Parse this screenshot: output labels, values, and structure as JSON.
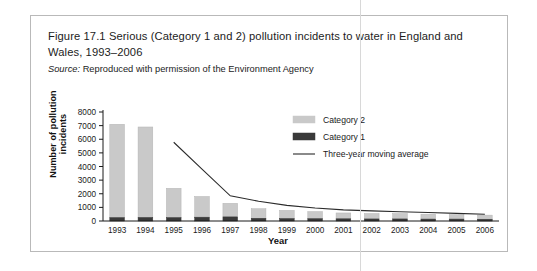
{
  "figure": {
    "caption_line1": "Figure 17.1  Serious (Category 1 and 2) pollution incidents to water in England and",
    "caption_line2": "Wales, 1993–2006",
    "source_label": "Source:",
    "source_text": "Reproduced with permission of the Environment Agency"
  },
  "chart_data": {
    "type": "bar",
    "title": "Figure 17.1  Serious (Category 1 and 2) pollution incidents to water in England and Wales, 1993–2006",
    "xlabel": "Year",
    "ylabel": "Number of pollution incidents",
    "categories": [
      "1993",
      "1994",
      "1995",
      "1996",
      "1997",
      "1998",
      "1999",
      "2000",
      "2001",
      "2002",
      "2003",
      "2004",
      "2005",
      "2006"
    ],
    "ylim": [
      0,
      8000
    ],
    "yticks": [
      0,
      1000,
      2000,
      3000,
      4000,
      5000,
      6000,
      7000,
      8000
    ],
    "ytick_labels": [
      "0",
      "1000",
      "2000",
      "3000",
      "4000",
      "5000",
      "6000",
      "7000",
      "8000"
    ],
    "grid": false,
    "stacked": true,
    "legend_position": "upper-right",
    "series": [
      {
        "name": "Category 2",
        "type": "bar",
        "color": "#c9c9c9",
        "values": [
          6850,
          6640,
          2150,
          1520,
          1000,
          700,
          600,
          520,
          430,
          400,
          400,
          360,
          330,
          300
        ]
      },
      {
        "name": "Category 1",
        "type": "bar",
        "color": "#3a3a3a",
        "values": [
          250,
          260,
          250,
          280,
          300,
          200,
          180,
          170,
          160,
          150,
          150,
          140,
          140,
          130
        ]
      },
      {
        "name": "Three-year moving average",
        "type": "line",
        "color": "#2b2b2b",
        "x": [
          "1995",
          "1996",
          "1997",
          "1998",
          "1999",
          "2000",
          "2001",
          "2002",
          "2003",
          "2004",
          "2005",
          "2006"
        ],
        "values": [
          5780,
          3800,
          1850,
          1450,
          1150,
          950,
          820,
          740,
          680,
          620,
          560,
          500
        ]
      }
    ]
  },
  "legend": {
    "items": [
      {
        "label": "Category 2",
        "marker": "swatch",
        "color": "#c9c9c9"
      },
      {
        "label": "Category 1",
        "marker": "swatch",
        "color": "#3a3a3a"
      },
      {
        "label": "Three-year moving average",
        "marker": "line",
        "color": "#2b2b2b"
      }
    ]
  }
}
